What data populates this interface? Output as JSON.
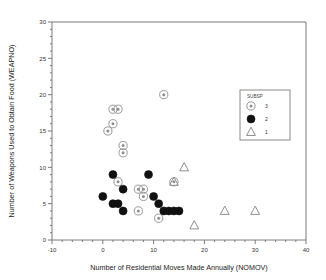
{
  "chart_data": {
    "type": "scatter",
    "title": "",
    "xlabel": "Number of Residential Moves Made Annually (NOMOV)",
    "ylabel": "Number of Weapons Used to Obtain Food (WEAPNO)",
    "xlim": [
      -10,
      40
    ],
    "ylim": [
      0,
      30
    ],
    "xticks": [
      -10,
      0,
      10,
      20,
      30,
      40
    ],
    "yticks": [
      0,
      5,
      10,
      15,
      20,
      25,
      30
    ],
    "xtick_labels": [
      "-10",
      "0",
      "10",
      "20",
      "30",
      "40"
    ],
    "ytick_labels": [
      "0",
      "5",
      "10",
      "15",
      "20",
      "25",
      "30"
    ],
    "minor_ticks": true,
    "grid": false,
    "legend": {
      "title": "SUBSP",
      "position": "top-right",
      "entries": [
        {
          "label": "3",
          "marker": "open-circle-dot"
        },
        {
          "label": "2",
          "marker": "filled-circle"
        },
        {
          "label": "1",
          "marker": "open-triangle"
        }
      ]
    },
    "series": [
      {
        "name": "3",
        "marker": "open-circle-dot",
        "color": "#9a9a9a",
        "points": [
          [
            1,
            15
          ],
          [
            2,
            18
          ],
          [
            3,
            18
          ],
          [
            2,
            16
          ],
          [
            4,
            13
          ],
          [
            4,
            12
          ],
          [
            12,
            20
          ],
          [
            3,
            8
          ],
          [
            7,
            7
          ],
          [
            8,
            7
          ],
          [
            8,
            6
          ],
          [
            7,
            4
          ],
          [
            11,
            3
          ],
          [
            14,
            8
          ]
        ]
      },
      {
        "name": "2",
        "marker": "filled-circle",
        "color": "#111111",
        "points": [
          [
            0,
            6
          ],
          [
            2,
            9
          ],
          [
            4,
            7
          ],
          [
            2,
            5
          ],
          [
            3,
            5
          ],
          [
            4,
            4
          ],
          [
            9,
            9
          ],
          [
            10,
            6
          ],
          [
            11,
            5
          ],
          [
            12,
            4
          ],
          [
            13,
            4
          ],
          [
            14,
            4
          ],
          [
            15,
            4
          ]
        ]
      },
      {
        "name": "1",
        "marker": "open-triangle",
        "color": "#8f8f8f",
        "points": [
          [
            16,
            10
          ],
          [
            14,
            8
          ],
          [
            18,
            2
          ],
          [
            24,
            4
          ],
          [
            30,
            4
          ]
        ]
      }
    ]
  }
}
